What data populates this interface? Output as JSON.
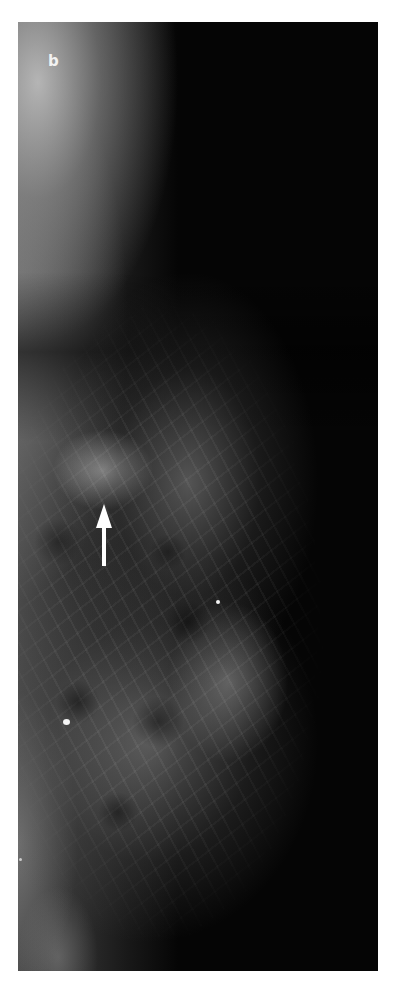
{
  "figure": {
    "panel_label": "b",
    "annotations": [
      {
        "type": "arrow",
        "direction": "up",
        "color": "#ffffff"
      }
    ],
    "colors": {
      "background": "#ffffff",
      "image_dark": "#050505",
      "tissue": "#a0a0a0",
      "arrow": "#ffffff"
    }
  }
}
